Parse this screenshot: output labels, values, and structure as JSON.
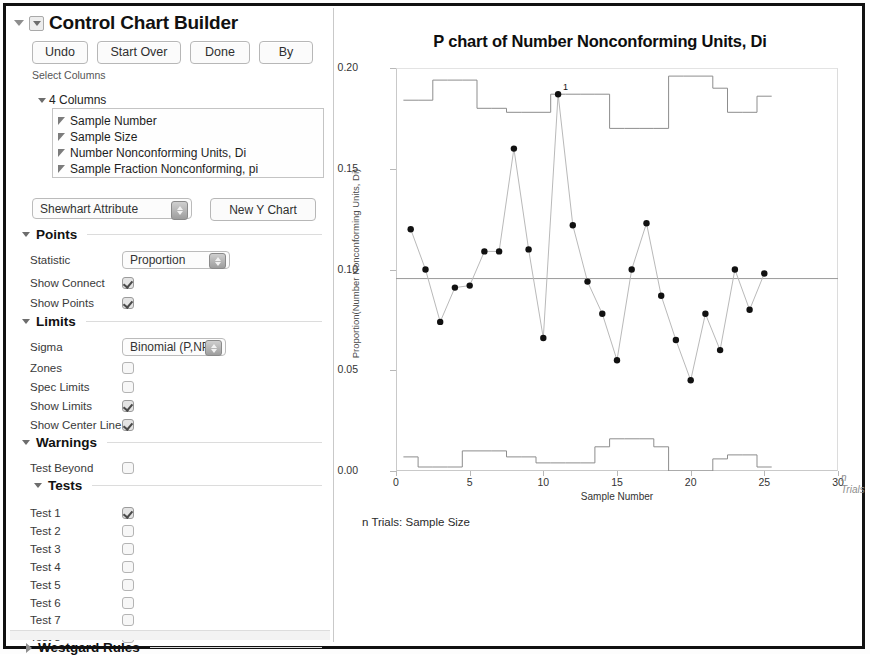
{
  "window": {
    "title": "Control Chart Builder"
  },
  "toolbar": {
    "undo_label": "Undo",
    "start_over_label": "Start Over",
    "done_label": "Done",
    "by_label": "By"
  },
  "select_columns": {
    "section_label": "Select Columns",
    "group_label": "4 Columns",
    "items": [
      {
        "label": "Sample Number"
      },
      {
        "label": "Sample Size"
      },
      {
        "label": "Number Nonconforming Units, Di"
      },
      {
        "label": "Sample Fraction Nonconforming, pi"
      }
    ]
  },
  "chart_type": {
    "selected": "Shewhart Attribute",
    "new_chart_label": "New Y Chart"
  },
  "points": {
    "title": "Points",
    "statistic_label": "Statistic",
    "statistic_value": "Proportion",
    "show_connect_label": "Show Connect",
    "show_connect_checked": true,
    "show_points_label": "Show Points",
    "show_points_checked": true
  },
  "limits": {
    "title": "Limits",
    "sigma_label": "Sigma",
    "sigma_value": "Binomial (P,NP)",
    "zones_label": "Zones",
    "zones_checked": false,
    "spec_limits_label": "Spec Limits",
    "spec_limits_checked": false,
    "show_limits_label": "Show Limits",
    "show_limits_checked": true,
    "show_center_line_label": "Show Center Line",
    "show_center_line_checked": true
  },
  "warnings": {
    "title": "Warnings",
    "test_beyond_label": "Test Beyond",
    "test_beyond_checked": false
  },
  "tests": {
    "title": "Tests",
    "items": [
      {
        "label": "Test 1",
        "checked": true
      },
      {
        "label": "Test 2",
        "checked": false
      },
      {
        "label": "Test 3",
        "checked": false
      },
      {
        "label": "Test 4",
        "checked": false
      },
      {
        "label": "Test 5",
        "checked": false
      },
      {
        "label": "Test 6",
        "checked": false
      },
      {
        "label": "Test 7",
        "checked": false
      },
      {
        "label": "Test 8",
        "checked": false
      }
    ]
  },
  "westgard": {
    "title": "Westgard Rules"
  },
  "chart_data": {
    "type": "line",
    "title": "P chart of Number Nonconforming Units, Di",
    "phase_label": "Phase",
    "xlabel": "Sample Number",
    "ylabel": "Proportion(Number Nonconforming Units, Di)",
    "caption": "n Trials: Sample Size",
    "n_trials_annotation": "n\nTrials",
    "xlim": [
      0,
      30
    ],
    "ylim": [
      0.0,
      0.2
    ],
    "xticks": [
      0,
      5,
      10,
      15,
      20,
      25,
      30
    ],
    "xticklabels": [
      "0",
      "5",
      "10",
      "15",
      "20",
      "25",
      "30"
    ],
    "yticks": [
      0.0,
      0.05,
      0.1,
      0.15,
      0.2
    ],
    "yticklabels": [
      "0.00",
      "0.05",
      "0.10",
      "0.15",
      "0.20"
    ],
    "grid": false,
    "legend": "none",
    "center_line": 0.0955,
    "marker_color": "#111111",
    "line_color": "#b9b9b9",
    "limit_color": "#8d8d8d",
    "x": [
      1,
      2,
      3,
      4,
      5,
      6,
      7,
      8,
      9,
      10,
      11,
      12,
      13,
      14,
      15,
      16,
      17,
      18,
      19,
      20,
      21,
      22,
      23,
      24,
      25
    ],
    "series": [
      {
        "name": "Proportion",
        "values": [
          0.12,
          0.1,
          0.074,
          0.091,
          0.092,
          0.109,
          0.109,
          0.16,
          0.11,
          0.066,
          0.187,
          0.122,
          0.094,
          0.078,
          0.055,
          0.1,
          0.123,
          0.087,
          0.065,
          0.045,
          0.078,
          0.06,
          0.1,
          0.08,
          0.098
        ]
      },
      {
        "name": "UCL",
        "values": [
          0.184,
          0.184,
          0.194,
          0.194,
          0.194,
          0.18,
          0.18,
          0.178,
          0.178,
          0.178,
          0.187,
          0.187,
          0.187,
          0.187,
          0.17,
          0.17,
          0.17,
          0.17,
          0.196,
          0.196,
          0.196,
          0.19,
          0.178,
          0.178,
          0.186
        ]
      },
      {
        "name": "LCL",
        "values": [
          0.007,
          0.002,
          0.002,
          0.002,
          0.01,
          0.01,
          0.01,
          0.007,
          0.007,
          0.004,
          0.004,
          0.004,
          0.004,
          0.012,
          0.016,
          0.016,
          0.016,
          0.012,
          0.0,
          0.0,
          0.0,
          0.006,
          0.008,
          0.008,
          0.002
        ]
      }
    ],
    "out_of_control": [
      {
        "index": 11,
        "value": 0.187,
        "label": "1"
      }
    ]
  }
}
